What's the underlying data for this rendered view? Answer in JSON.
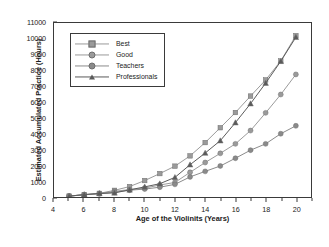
{
  "chart_data": {
    "type": "line",
    "title": "",
    "xlabel": "Age of the Violinits (Years)",
    "ylabel": "Estimated Accumulated Practice (Hours)",
    "xlim": [
      4,
      21
    ],
    "ylim": [
      0,
      11000
    ],
    "grid": false,
    "legend_position": "upper-left-inside",
    "x": [
      5,
      6,
      7,
      8,
      9,
      10,
      11,
      12,
      13,
      14,
      15,
      16,
      17,
      18,
      19,
      20
    ],
    "xticks": [
      4,
      6,
      8,
      10,
      12,
      14,
      16,
      18,
      20
    ],
    "yticks": [
      0,
      1000,
      2000,
      3000,
      4000,
      5000,
      6000,
      7000,
      8000,
      9000,
      10000,
      11000
    ],
    "series": [
      {
        "name": "Best",
        "marker": "square",
        "color": "#9a9a9a",
        "values": [
          60,
          150,
          230,
          420,
          660,
          1040,
          1480,
          1950,
          2600,
          3440,
          4380,
          5340,
          6380,
          7400,
          8600,
          10200
        ]
      },
      {
        "name": "Good",
        "marker": "circle",
        "color": "#9a9a9a",
        "values": [
          50,
          140,
          200,
          300,
          440,
          560,
          700,
          880,
          1320,
          1700,
          1980,
          2460,
          2980,
          3380,
          4020,
          4500
        ]
      },
      {
        "name": "Teachers",
        "marker": "circle",
        "color": "#8a8a8a",
        "values": [
          55,
          145,
          215,
          340,
          470,
          520,
          640,
          800,
          1280,
          1620,
          1960,
          2450,
          2960,
          3360,
          4000,
          4480
        ]
      },
      {
        "name": "Professionals",
        "marker": "triangle",
        "color": "#5a5a5a",
        "values": [
          55,
          150,
          225,
          260,
          450,
          640,
          840,
          1240,
          2040,
          2780,
          3560,
          4700,
          5900,
          7200,
          8580,
          10100
        ]
      }
    ],
    "series_plotted": [
      {
        "name": "Best",
        "marker": "square",
        "color": "#9a9a9a",
        "points": [
          [
            5,
            60
          ],
          [
            6,
            150
          ],
          [
            7,
            230
          ],
          [
            8,
            420
          ],
          [
            9,
            660
          ],
          [
            10,
            1040
          ],
          [
            11,
            1480
          ],
          [
            12,
            1950
          ],
          [
            13,
            2600
          ],
          [
            14,
            3440
          ],
          [
            15,
            4380
          ],
          [
            16,
            5340
          ],
          [
            17,
            6380
          ],
          [
            18,
            7400
          ],
          [
            19,
            8600
          ],
          [
            20,
            10200
          ]
        ]
      },
      {
        "name": "Good",
        "marker": "circle",
        "color": "#9a9a9a",
        "points": [
          [
            5,
            55
          ],
          [
            6,
            150
          ],
          [
            7,
            220
          ],
          [
            8,
            360
          ],
          [
            9,
            470
          ],
          [
            10,
            560
          ],
          [
            11,
            760
          ],
          [
            12,
            920
          ],
          [
            13,
            1560
          ],
          [
            14,
            2180
          ],
          [
            15,
            2760
          ],
          [
            16,
            3360
          ],
          [
            17,
            4200
          ],
          [
            18,
            5320
          ],
          [
            19,
            6480
          ],
          [
            20,
            7750
          ]
        ]
      },
      {
        "name": "Teachers",
        "marker": "circle",
        "color": "#8a8a8a",
        "points": [
          [
            5,
            50
          ],
          [
            6,
            140
          ],
          [
            7,
            200
          ],
          [
            8,
            300
          ],
          [
            9,
            430
          ],
          [
            10,
            500
          ],
          [
            11,
            620
          ],
          [
            12,
            800
          ],
          [
            13,
            1270
          ],
          [
            14,
            1620
          ],
          [
            15,
            1960
          ],
          [
            16,
            2450
          ],
          [
            17,
            2960
          ],
          [
            18,
            3360
          ],
          [
            19,
            4000
          ],
          [
            20,
            4500
          ]
        ]
      },
      {
        "name": "Professionals",
        "marker": "triangle",
        "color": "#5a5a5a",
        "points": [
          [
            5,
            55
          ],
          [
            6,
            150
          ],
          [
            7,
            225
          ],
          [
            8,
            260
          ],
          [
            9,
            450
          ],
          [
            10,
            640
          ],
          [
            11,
            840
          ],
          [
            12,
            1240
          ],
          [
            13,
            2040
          ],
          [
            14,
            2780
          ],
          [
            15,
            3560
          ],
          [
            16,
            4700
          ],
          [
            17,
            5900
          ],
          [
            18,
            7200
          ],
          [
            19,
            8580
          ],
          [
            20,
            10100
          ]
        ]
      }
    ]
  },
  "legend": {
    "items": [
      {
        "label": "Best"
      },
      {
        "label": "Good"
      },
      {
        "label": "Teachers"
      },
      {
        "label": "Professionals"
      }
    ]
  }
}
